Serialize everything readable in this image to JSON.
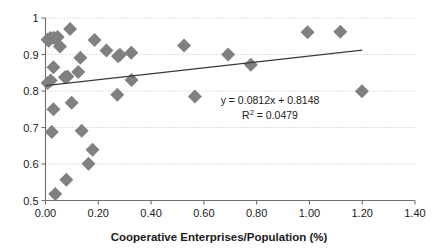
{
  "chart_data": {
    "type": "scatter",
    "title": "",
    "xlabel": "Cooperative Enterprises/Population (%)",
    "ylabel": "",
    "xlim": [
      0.0,
      1.4
    ],
    "ylim": [
      0.5,
      1.0
    ],
    "xticks": [
      0.0,
      0.2,
      0.4,
      0.6,
      0.8,
      1.0,
      1.2,
      1.4
    ],
    "xtick_labels": [
      "0.00",
      "0.20",
      "0.40",
      "0.60",
      "0.80",
      "1.00",
      "1.20",
      "1.40"
    ],
    "yticks": [
      0.5,
      0.6,
      0.7,
      0.8,
      0.9,
      1.0
    ],
    "ytick_labels": [
      "0.5",
      "0.6",
      "0.7",
      "0.8",
      "0.9",
      "1"
    ],
    "grid": "horizontal-dotted",
    "legend": "none",
    "marker": {
      "shape": "diamond",
      "color": "#808080",
      "size": 7
    },
    "points": [
      {
        "x": 0.008,
        "y": 0.941
      },
      {
        "x": 0.012,
        "y": 0.938
      },
      {
        "x": 0.018,
        "y": 0.945
      },
      {
        "x": 0.03,
        "y": 0.946
      },
      {
        "x": 0.038,
        "y": 0.944
      },
      {
        "x": 0.046,
        "y": 0.948
      },
      {
        "x": 0.093,
        "y": 0.97
      },
      {
        "x": 0.055,
        "y": 0.922
      },
      {
        "x": 0.186,
        "y": 0.94
      },
      {
        "x": 0.231,
        "y": 0.911
      },
      {
        "x": 0.275,
        "y": 0.895
      },
      {
        "x": 0.282,
        "y": 0.899
      },
      {
        "x": 0.325,
        "y": 0.905
      },
      {
        "x": 0.525,
        "y": 0.925
      },
      {
        "x": 0.692,
        "y": 0.9
      },
      {
        "x": 0.778,
        "y": 0.872
      },
      {
        "x": 0.993,
        "y": 0.961
      },
      {
        "x": 1.117,
        "y": 0.962
      },
      {
        "x": 0.03,
        "y": 0.865
      },
      {
        "x": 0.132,
        "y": 0.891
      },
      {
        "x": 0.124,
        "y": 0.852
      },
      {
        "x": 0.074,
        "y": 0.838
      },
      {
        "x": 0.083,
        "y": 0.84
      },
      {
        "x": 0.02,
        "y": 0.829
      },
      {
        "x": 0.008,
        "y": 0.822
      },
      {
        "x": 0.326,
        "y": 0.83
      },
      {
        "x": 0.272,
        "y": 0.79
      },
      {
        "x": 0.566,
        "y": 0.785
      },
      {
        "x": 1.199,
        "y": 0.799
      },
      {
        "x": 0.099,
        "y": 0.768
      },
      {
        "x": 0.03,
        "y": 0.75
      },
      {
        "x": 0.024,
        "y": 0.688
      },
      {
        "x": 0.137,
        "y": 0.691
      },
      {
        "x": 0.178,
        "y": 0.639
      },
      {
        "x": 0.163,
        "y": 0.601
      },
      {
        "x": 0.079,
        "y": 0.557
      },
      {
        "x": 0.037,
        "y": 0.518
      }
    ],
    "trendline": {
      "equation_label": "y = 0.0812x + 0.8148",
      "r2_label_prefix": "R",
      "r2_label_sup": "2",
      "r2_label_suffix": " = 0.0479",
      "slope": 0.0812,
      "intercept": 0.8148,
      "r2": 0.0479,
      "x_start": 0.0,
      "x_end": 1.2,
      "color": "#3a3a3a"
    }
  }
}
